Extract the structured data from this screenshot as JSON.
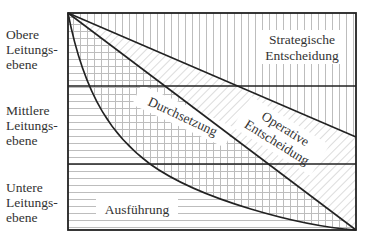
{
  "levels": [
    {
      "id": "top",
      "label": "Obere\nLeitungs-\nebene"
    },
    {
      "id": "middle",
      "label": "Mittlere\nLeitungs-\nebene"
    },
    {
      "id": "bottom",
      "label": "Untere\nLeitungs-\nebene"
    }
  ],
  "regions": {
    "strategic": {
      "line1": "Strategische",
      "line2": "Entscheidung"
    },
    "operative": {
      "line1": "Operative",
      "line2": "Entscheidung"
    },
    "implementation": {
      "label": "Durchsetzung"
    },
    "execution": {
      "label": "Ausführung"
    }
  },
  "colors": {
    "stroke": "#222222",
    "hatch": "#b8b8b8",
    "background": "#ffffff"
  }
}
